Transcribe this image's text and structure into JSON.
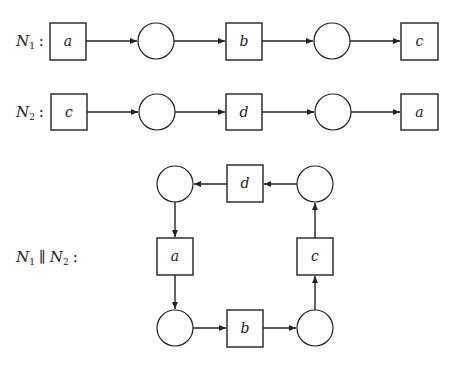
{
  "diagram": {
    "type": "petri-net-composition",
    "nets": [
      {
        "id": "N1",
        "label_main": "N",
        "label_sub": "1",
        "colon": ":",
        "sequence": [
          "a",
          "place",
          "b",
          "place",
          "c"
        ]
      },
      {
        "id": "N2",
        "label_main": "N",
        "label_sub": "2",
        "colon": ":",
        "sequence": [
          "c",
          "place",
          "d",
          "place",
          "a"
        ]
      }
    ],
    "composition": {
      "label_n1": "N",
      "label_n1_sub": "1",
      "operator": "∥",
      "label_n2": "N",
      "label_n2_sub": "2",
      "colon": ":",
      "transitions": {
        "top": "d",
        "left": "a",
        "bottom": "b",
        "right": "c"
      },
      "cycle": [
        "place-top-left",
        "a",
        "place-bottom-left",
        "b",
        "place-bottom-right",
        "c",
        "place-top-right",
        "d"
      ]
    },
    "n1_transitions": {
      "t1": "a",
      "t2": "b",
      "t3": "c"
    },
    "n2_transitions": {
      "t1": "c",
      "t2": "d",
      "t3": "a"
    }
  }
}
